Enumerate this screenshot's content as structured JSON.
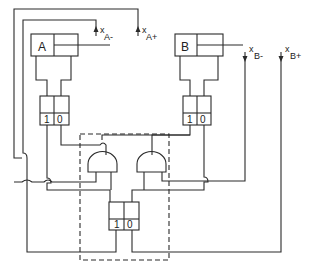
{
  "diagram": {
    "type": "pneumatic-logic-circuit",
    "cylinders": [
      {
        "id": "A",
        "label": "A"
      },
      {
        "id": "B",
        "label": "B"
      }
    ],
    "valves": [
      {
        "id": "valve-a",
        "port_labels": [
          "1",
          "0"
        ]
      },
      {
        "id": "valve-b",
        "port_labels": [
          "1",
          "0"
        ]
      },
      {
        "id": "valve-center",
        "port_labels": [
          "1",
          "0"
        ]
      }
    ],
    "sensors": [
      {
        "id": "xA-",
        "main": "x",
        "sub": "A-"
      },
      {
        "id": "xA+",
        "main": "x",
        "sub": "A+"
      },
      {
        "id": "xB-",
        "main": "x",
        "sub": "B-"
      },
      {
        "id": "xB+",
        "main": "x",
        "sub": "B+"
      }
    ],
    "gates": [
      {
        "id": "and-left",
        "type": "AND"
      },
      {
        "id": "and-right",
        "type": "AND"
      }
    ],
    "colors": {
      "line": "#2a2a2a",
      "background": "#ffffff"
    }
  }
}
